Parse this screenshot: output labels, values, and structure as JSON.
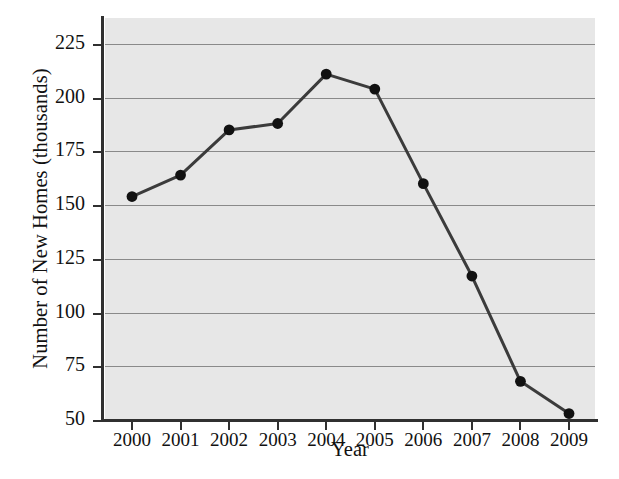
{
  "chart_data": {
    "type": "line",
    "title": "",
    "xlabel": "Year",
    "ylabel": "Number of New Homes (thousands)",
    "categories": [
      "2000",
      "2001",
      "2002",
      "2003",
      "2004",
      "2005",
      "2006",
      "2007",
      "2008",
      "2009"
    ],
    "values": [
      154,
      164,
      185,
      188,
      211,
      204,
      160,
      117,
      68,
      53
    ],
    "series": [
      {
        "name": "Number of New Homes (thousands)",
        "values": [
          154,
          164,
          185,
          188,
          211,
          204,
          160,
          117,
          68,
          53
        ]
      }
    ],
    "ylim": [
      50,
      225
    ],
    "yticks": [
      50,
      75,
      100,
      125,
      150,
      175,
      200,
      225
    ],
    "ytick_labels": [
      "50",
      "75",
      "100",
      "125",
      "150",
      "175",
      "200",
      "225"
    ],
    "xtick_labels": [
      "2000",
      "2001",
      "2002",
      "2003",
      "2004",
      "2005",
      "2006",
      "2007",
      "2008",
      "2009"
    ],
    "grid": true,
    "grid_axis": "y",
    "legend": false,
    "legend_position": "none",
    "marker": "filled-circle",
    "colors": {
      "plot_background": "#e7e7e7",
      "page_background": "#ffffff",
      "gridline": "#8a8a8a",
      "axis": "#303030",
      "line": "#3b3b3b",
      "marker": "#111111",
      "text": "#111111"
    }
  }
}
